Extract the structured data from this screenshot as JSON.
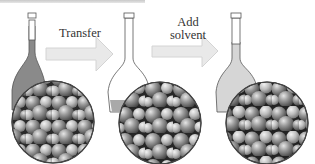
{
  "diagram": {
    "steps": [
      {
        "id": "flask-1",
        "fill": "dark",
        "liquid_color": "#8a8a8a"
      },
      {
        "id": "flask-2",
        "fill": "empty",
        "liquid_color": "#a9a9a9"
      },
      {
        "id": "flask-3",
        "fill": "light",
        "liquid_color": "#d6d6d6"
      }
    ],
    "arrows": [
      {
        "label": "Transfer"
      },
      {
        "label": "Add\nsolvent",
        "line1": "Add",
        "line2": "solvent"
      }
    ],
    "colors": {
      "arrow_fill": "#e9e9e9",
      "arrow_stroke": "#d0d0d0",
      "flask_outline": "#555555",
      "sphere_dark": "#3a3a3a",
      "sphere_mid": "#8c8c8c",
      "sphere_light": "#d8d8d8",
      "gap_color": "#1e1e1e"
    }
  }
}
